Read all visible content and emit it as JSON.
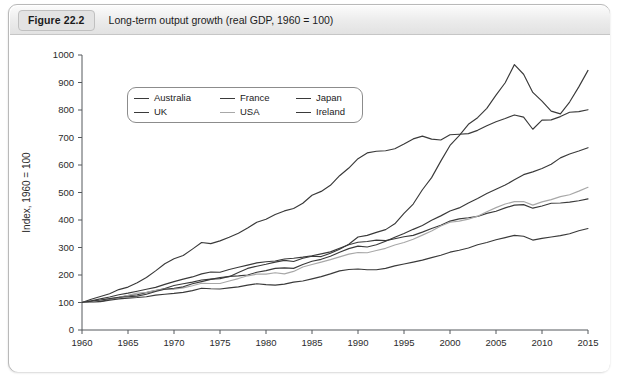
{
  "figure": {
    "badge": "Figure 22.2",
    "title": "Long-term output growth (real GDP, 1960 = 100)"
  },
  "legend": {
    "items": [
      {
        "label": "Australia",
        "color": "#3a3a3a"
      },
      {
        "label": "France",
        "color": "#3a3a3a"
      },
      {
        "label": "Japan",
        "color": "#3a3a3a"
      },
      {
        "label": "UK",
        "color": "#3a3a3a"
      },
      {
        "label": "USA",
        "color": "#a8a8a8"
      },
      {
        "label": "Ireland",
        "color": "#3a3a3a"
      }
    ]
  },
  "chart_data": {
    "type": "line",
    "title": "Long-term output growth (real GDP, 1960 = 100)",
    "xlabel": "",
    "ylabel": "Index, 1960 = 100",
    "xlim": [
      1960,
      2015
    ],
    "ylim": [
      0,
      1000
    ],
    "xticks": [
      1960,
      1965,
      1970,
      1975,
      1980,
      1985,
      1990,
      1995,
      2000,
      2005,
      2010,
      2015
    ],
    "yticks": [
      0,
      100,
      200,
      300,
      400,
      500,
      600,
      700,
      800,
      900,
      1000
    ],
    "grid": false,
    "legend_position": "top-left",
    "x": [
      1960,
      1961,
      1962,
      1963,
      1964,
      1965,
      1966,
      1967,
      1968,
      1969,
      1970,
      1971,
      1972,
      1973,
      1974,
      1975,
      1976,
      1977,
      1978,
      1979,
      1980,
      1981,
      1982,
      1983,
      1984,
      1985,
      1986,
      1987,
      1988,
      1989,
      1990,
      1991,
      1992,
      1993,
      1994,
      1995,
      1996,
      1997,
      1998,
      1999,
      2000,
      2001,
      2002,
      2003,
      2004,
      2005,
      2006,
      2007,
      2008,
      2009,
      2010,
      2011,
      2012,
      2013,
      2014,
      2015
    ],
    "series": [
      {
        "name": "Australia",
        "color": "#3a3a3a",
        "values": [
          100,
          103,
          104,
          111,
          118,
          125,
          128,
          136,
          143,
          151,
          162,
          168,
          174,
          182,
          185,
          187,
          195,
          197,
          200,
          210,
          216,
          224,
          226,
          224,
          238,
          250,
          257,
          268,
          283,
          296,
          305,
          302,
          310,
          323,
          337,
          351,
          366,
          380,
          399,
          415,
          433,
          444,
          462,
          478,
          496,
          512,
          527,
          546,
          565,
          575,
          587,
          603,
          626,
          640,
          651,
          663
        ]
      },
      {
        "name": "France",
        "color": "#3a3a3a",
        "values": [
          100,
          106,
          113,
          120,
          128,
          134,
          141,
          148,
          155,
          166,
          176,
          185,
          193,
          204,
          211,
          210,
          220,
          228,
          236,
          244,
          248,
          251,
          258,
          261,
          265,
          270,
          277,
          284,
          297,
          310,
          319,
          322,
          327,
          325,
          332,
          339,
          344,
          356,
          369,
          381,
          396,
          404,
          408,
          413,
          424,
          432,
          444,
          454,
          456,
          443,
          451,
          461,
          462,
          465,
          470,
          477
        ]
      },
      {
        "name": "Japan",
        "color": "#3a3a3a",
        "values": [
          100,
          112,
          122,
          132,
          147,
          156,
          172,
          191,
          215,
          241,
          259,
          271,
          294,
          318,
          314,
          324,
          337,
          352,
          371,
          392,
          403,
          420,
          433,
          442,
          461,
          490,
          504,
          526,
          561,
          589,
          623,
          644,
          650,
          652,
          659,
          676,
          695,
          705,
          694,
          691,
          710,
          712,
          714,
          726,
          743,
          757,
          769,
          782,
          774,
          730,
          763,
          764,
          776,
          792,
          794,
          801
        ]
      },
      {
        "name": "UK",
        "color": "#3a3a3a",
        "values": [
          100,
          102,
          103,
          108,
          113,
          116,
          118,
          121,
          127,
          130,
          133,
          137,
          143,
          152,
          150,
          149,
          153,
          157,
          163,
          168,
          165,
          163,
          167,
          174,
          178,
          186,
          194,
          204,
          215,
          220,
          222,
          219,
          219,
          224,
          233,
          240,
          247,
          254,
          263,
          272,
          283,
          290,
          298,
          310,
          318,
          328,
          336,
          344,
          341,
          327,
          333,
          338,
          343,
          350,
          361,
          369
        ]
      },
      {
        "name": "USA",
        "color": "#a8a8a8",
        "values": [
          100,
          102,
          109,
          113,
          119,
          126,
          134,
          137,
          144,
          148,
          148,
          153,
          161,
          170,
          169,
          169,
          178,
          187,
          197,
          203,
          203,
          208,
          204,
          213,
          229,
          238,
          247,
          256,
          266,
          276,
          282,
          281,
          289,
          297,
          309,
          318,
          330,
          345,
          360,
          378,
          392,
          396,
          403,
          414,
          430,
          445,
          458,
          467,
          467,
          454,
          466,
          474,
          485,
          492,
          505,
          519
        ]
      },
      {
        "name": "Ireland",
        "color": "#3a3a3a",
        "values": [
          100,
          105,
          109,
          114,
          119,
          121,
          123,
          130,
          140,
          148,
          152,
          157,
          168,
          176,
          184,
          191,
          194,
          209,
          224,
          232,
          239,
          247,
          253,
          249,
          261,
          268,
          267,
          279,
          294,
          312,
          338,
          344,
          355,
          365,
          386,
          424,
          458,
          510,
          554,
          614,
          671,
          707,
          748,
          772,
          806,
          854,
          899,
          965,
          930,
          864,
          832,
          796,
          786,
          829,
          884,
          944
        ]
      }
    ]
  }
}
